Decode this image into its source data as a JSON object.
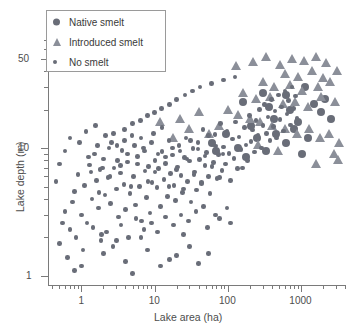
{
  "chart_data": {
    "type": "scatter",
    "title": "",
    "xlabel": "Lake area (ha)",
    "ylabel": "Lake depth (m)",
    "xscale": "log",
    "yscale": "log",
    "xlim": [
      0.35,
      4000
    ],
    "ylim": [
      0.85,
      70
    ],
    "xticks": [
      1,
      10,
      100,
      1000
    ],
    "xticklabels": [
      "1",
      "10",
      "100",
      "1000"
    ],
    "yticks": [
      1,
      10,
      50
    ],
    "yticklabels": [
      "1",
      "10",
      "50"
    ],
    "grid": false,
    "legend_position": "top-left",
    "series": [
      {
        "name": "Native smelt",
        "marker": "circle-large",
        "color": "#696d78",
        "points": [
          [
            160,
            23
          ],
          [
            300,
            27
          ],
          [
            620,
            26
          ],
          [
            1150,
            30
          ],
          [
            1500,
            22
          ],
          [
            430,
            17
          ],
          [
            800,
            14
          ],
          [
            250,
            12
          ],
          [
            95,
            13
          ],
          [
            1900,
            19
          ],
          [
            620,
            11
          ],
          [
            330,
            9.5
          ],
          [
            1250,
            12
          ],
          [
            180,
            8.5
          ],
          [
            700,
            20
          ],
          [
            2100,
            24
          ],
          [
            140,
            10
          ],
          [
            60,
            11
          ],
          [
            900,
            16
          ],
          [
            2600,
            17
          ],
          [
            460,
            13
          ],
          [
            1050,
            9
          ],
          [
            210,
            15
          ],
          [
            70,
            9.5
          ],
          [
            370,
            21
          ]
        ]
      },
      {
        "name": "Introduced smelt",
        "marker": "triangle",
        "color": "#8b8f99",
        "points": [
          [
            130,
            44
          ],
          [
            220,
            47
          ],
          [
            330,
            52
          ],
          [
            520,
            45
          ],
          [
            760,
            50
          ],
          [
            1100,
            48
          ],
          [
            1600,
            52
          ],
          [
            2200,
            46
          ],
          [
            600,
            38
          ],
          [
            900,
            36
          ],
          [
            1400,
            40
          ],
          [
            2000,
            35
          ],
          [
            300,
            33
          ],
          [
            430,
            30
          ],
          [
            700,
            31
          ],
          [
            1050,
            28
          ],
          [
            1700,
            30
          ],
          [
            2500,
            33
          ],
          [
            160,
            27
          ],
          [
            240,
            24
          ],
          [
            380,
            25
          ],
          [
            560,
            22
          ],
          [
            820,
            23
          ],
          [
            1250,
            21
          ],
          [
            1900,
            25
          ],
          [
            2900,
            23
          ],
          [
            3100,
            40
          ],
          [
            3300,
            11
          ],
          [
            100,
            20
          ],
          [
            140,
            18
          ],
          [
            200,
            17
          ],
          [
            280,
            16
          ],
          [
            400,
            15
          ],
          [
            600,
            14
          ],
          [
            880,
            13
          ],
          [
            1300,
            14
          ],
          [
            1800,
            12
          ],
          [
            2400,
            13
          ],
          [
            75,
            15
          ],
          [
            55,
            13
          ],
          [
            40,
            19
          ],
          [
            30,
            14
          ],
          [
            22,
            17
          ],
          [
            18,
            12
          ],
          [
            12,
            16
          ],
          [
            2800,
            9
          ],
          [
            3200,
            8
          ],
          [
            480,
            9.5
          ],
          [
            260,
            10.5
          ],
          [
            1600,
            7.5
          ]
        ]
      },
      {
        "name": "No smelt",
        "marker": "circle-small",
        "color": "#696d78",
        "points": [
          [
            0.6,
            3.2
          ],
          [
            0.7,
            2.3
          ],
          [
            0.8,
            4.6
          ],
          [
            0.9,
            6.2
          ],
          [
            1.0,
            3.0
          ],
          [
            1.1,
            5.1
          ],
          [
            1.2,
            2.6
          ],
          [
            1.3,
            7.4
          ],
          [
            1.4,
            4.0
          ],
          [
            1.5,
            9.0
          ],
          [
            1.6,
            5.6
          ],
          [
            1.7,
            3.4
          ],
          [
            1.8,
            6.8
          ],
          [
            1.9,
            2.1
          ],
          [
            2.0,
            8.2
          ],
          [
            2.1,
            4.3
          ],
          [
            2.3,
            5.9
          ],
          [
            2.5,
            3.7
          ],
          [
            2.6,
            11.0
          ],
          [
            2.8,
            7.0
          ],
          [
            3.0,
            4.8
          ],
          [
            3.2,
            2.9
          ],
          [
            3.4,
            6.4
          ],
          [
            3.6,
            9.6
          ],
          [
            3.8,
            5.2
          ],
          [
            4.0,
            3.3
          ],
          [
            4.3,
            7.8
          ],
          [
            4.6,
            4.4
          ],
          [
            4.9,
            12.5
          ],
          [
            5.2,
            6.0
          ],
          [
            5.5,
            3.6
          ],
          [
            5.8,
            8.6
          ],
          [
            6.2,
            5.0
          ],
          [
            6.6,
            2.7
          ],
          [
            7.0,
            10.0
          ],
          [
            7.4,
            6.6
          ],
          [
            7.8,
            4.1
          ],
          [
            8.2,
            7.2
          ],
          [
            8.7,
            3.1
          ],
          [
            9.2,
            5.4
          ],
          [
            9.7,
            13.0
          ],
          [
            10.2,
            8.0
          ],
          [
            10.8,
            4.9
          ],
          [
            11.4,
            6.9
          ],
          [
            12.0,
            3.5
          ],
          [
            12.7,
            9.4
          ],
          [
            13.4,
            5.7
          ],
          [
            14.1,
            7.6
          ],
          [
            14.9,
            4.2
          ],
          [
            15.7,
            11.5
          ],
          [
            16.6,
            6.3
          ],
          [
            17.5,
            8.8
          ],
          [
            18.5,
            5.1
          ],
          [
            19.5,
            3.9
          ],
          [
            20.6,
            7.1
          ],
          [
            21.7,
            10.5
          ],
          [
            22.9,
            6.1
          ],
          [
            24.2,
            4.5
          ],
          [
            25.5,
            8.4
          ],
          [
            26.9,
            12.0
          ],
          [
            28.4,
            5.5
          ],
          [
            30.0,
            7.9
          ],
          [
            31.6,
            3.8
          ],
          [
            33.4,
            9.9
          ],
          [
            35.2,
            6.5
          ],
          [
            37.2,
            4.7
          ],
          [
            39.2,
            11.0
          ],
          [
            41.4,
            8.1
          ],
          [
            43.7,
            5.3
          ],
          [
            46.1,
            14.0
          ],
          [
            48.7,
            7.3
          ],
          [
            51.4,
            9.2
          ],
          [
            54.2,
            6.0
          ],
          [
            57.2,
            4.4
          ],
          [
            60.4,
            10.8
          ],
          [
            63.7,
            7.7
          ],
          [
            67.3,
            12.8
          ],
          [
            71.0,
            5.8
          ],
          [
            74.9,
            8.9
          ],
          [
            79.1,
            15.5
          ],
          [
            83.4,
            6.7
          ],
          [
            88.0,
            10.2
          ],
          [
            92.9,
            7.5
          ],
          [
            98.0,
            13.5
          ],
          [
            103.4,
            9.1
          ],
          [
            109.2,
            5.6
          ],
          [
            115.2,
            11.8
          ],
          [
            121.6,
            8.3
          ],
          [
            128.3,
            16.0
          ],
          [
            135.4,
            6.9
          ],
          [
            142.9,
            12.2
          ],
          [
            150.8,
            9.7
          ],
          [
            159.1,
            7.0
          ],
          [
            167.9,
            14.5
          ],
          [
            177.2,
            10.6
          ],
          [
            187.0,
            8.0
          ],
          [
            197.3,
            18.0
          ],
          [
            208.2,
            11.2
          ],
          [
            219.7,
            13.8
          ],
          [
            231.8,
            9.3
          ],
          [
            244.6,
            16.5
          ],
          [
            258.1,
            12.6
          ],
          [
            272.4,
            20.0
          ],
          [
            287.4,
            10.0
          ],
          [
            303.3,
            15.0
          ],
          [
            320.0,
            22.0
          ],
          [
            337.7,
            13.0
          ],
          [
            356.3,
            17.5
          ],
          [
            375.9,
            11.5
          ],
          [
            396.6,
            24.0
          ],
          [
            418.5,
            14.8
          ],
          [
            441.6,
            19.5
          ],
          [
            465.9,
            12.0
          ],
          [
            491.5,
            26.0
          ],
          [
            518.6,
            16.8
          ],
          [
            547.1,
            21.0
          ],
          [
            577.2,
            13.6
          ],
          [
            609.0,
            28.0
          ],
          [
            642.5,
            18.5
          ],
          [
            677.8,
            23.5
          ],
          [
            715.1,
            15.2
          ],
          [
            754.4,
            30.0
          ],
          [
            795.9,
            20.5
          ],
          [
            839.7,
            25.5
          ],
          [
            885.9,
            17.0
          ],
          [
            0.5,
            1.8
          ],
          [
            0.55,
            2.6
          ],
          [
            0.65,
            1.4
          ],
          [
            0.75,
            3.8
          ],
          [
            0.85,
            2.0
          ],
          [
            1.05,
            1.6
          ],
          [
            1.25,
            8.5
          ],
          [
            1.45,
            2.4
          ],
          [
            1.65,
            10.5
          ],
          [
            1.85,
            1.9
          ],
          [
            2.2,
            2.2
          ],
          [
            2.4,
            10.0
          ],
          [
            2.7,
            1.7
          ],
          [
            3.1,
            8.0
          ],
          [
            3.5,
            2.5
          ],
          [
            3.9,
            14.0
          ],
          [
            4.4,
            2.0
          ],
          [
            5.0,
            15.5
          ],
          [
            5.6,
            2.8
          ],
          [
            6.4,
            16.5
          ],
          [
            7.2,
            2.3
          ],
          [
            8.0,
            18.0
          ],
          [
            9.0,
            2.6
          ],
          [
            10.0,
            19.0
          ],
          [
            11.0,
            2.2
          ],
          [
            12.5,
            20.5
          ],
          [
            14.0,
            2.9
          ],
          [
            16.0,
            22.0
          ],
          [
            18.0,
            2.5
          ],
          [
            20.0,
            24.0
          ],
          [
            23.0,
            3.0
          ],
          [
            26.0,
            26.0
          ],
          [
            29.0,
            2.7
          ],
          [
            33.0,
            28.0
          ],
          [
            37.0,
            3.2
          ],
          [
            42.0,
            30.0
          ],
          [
            47.0,
            3.5
          ],
          [
            53.0,
            2.4
          ],
          [
            60.0,
            32.0
          ],
          [
            68.0,
            3.0
          ],
          [
            77.0,
            2.8
          ],
          [
            87.0,
            34.0
          ],
          [
            98.0,
            3.4
          ],
          [
            110.0,
            2.6
          ],
          [
            125.0,
            36.0
          ],
          [
            0.45,
            5.5
          ],
          [
            0.5,
            7.5
          ],
          [
            0.6,
            9.5
          ],
          [
            0.7,
            12.0
          ],
          [
            0.95,
            11.0
          ],
          [
            1.15,
            13.5
          ],
          [
            1.35,
            6.5
          ],
          [
            1.55,
            15.0
          ],
          [
            1.75,
            4.5
          ],
          [
            1.95,
            7.0
          ],
          [
            2.15,
            12.5
          ],
          [
            2.45,
            6.0
          ],
          [
            2.75,
            13.0
          ],
          [
            3.05,
            10.5
          ],
          [
            3.45,
            7.3
          ],
          [
            3.85,
            11.5
          ],
          [
            4.25,
            9.0
          ],
          [
            4.75,
            5.0
          ],
          [
            5.3,
            10.5
          ],
          [
            5.9,
            7.5
          ],
          [
            6.5,
            12.0
          ],
          [
            7.3,
            9.5
          ],
          [
            8.1,
            5.5
          ],
          [
            9.1,
            11.0
          ],
          [
            10.1,
            6.5
          ],
          [
            11.2,
            9.0
          ],
          [
            12.6,
            14.5
          ],
          [
            14.2,
            8.5
          ],
          [
            15.8,
            5.0
          ],
          [
            17.7,
            10.0
          ],
          [
            19.8,
            6.8
          ],
          [
            22.2,
            9.5
          ],
          [
            24.8,
            4.8
          ],
          [
            27.8,
            8.2
          ],
          [
            31.1,
            11.5
          ],
          [
            34.8,
            6.2
          ],
          [
            39.0,
            9.8
          ],
          [
            43.6,
            5.4
          ],
          [
            48.8,
            8.7
          ],
          [
            54.6,
            12.5
          ],
          [
            61.1,
            7.2
          ],
          [
            68.4,
            10.4
          ],
          [
            76.5,
            5.9
          ],
          [
            85.6,
            9.0
          ],
          [
            95.8,
            13.2
          ],
          [
            1.0,
            1.2
          ],
          [
            2.0,
            1.5
          ],
          [
            4.0,
            1.3
          ],
          [
            8.0,
            1.6
          ],
          [
            16.0,
            1.35
          ],
          [
            5.0,
            1.05
          ],
          [
            30.0,
            1.7
          ],
          [
            55.0,
            1.5
          ],
          [
            12.0,
            1.2
          ],
          [
            0.8,
            1.1
          ],
          [
            20.0,
            1.45
          ],
          [
            40.0,
            1.25
          ],
          [
            3.0,
            1.9
          ],
          [
            6.5,
            2.0
          ],
          [
            25.0,
            2.1
          ]
        ]
      }
    ]
  },
  "legend": {
    "items": [
      {
        "label": "Native smelt",
        "marker": "circle-large"
      },
      {
        "label": "Introduced smelt",
        "marker": "triangle"
      },
      {
        "label": "No smelt",
        "marker": "circle-small"
      }
    ]
  },
  "colors": {
    "marker": "#696d78",
    "triangle": "#8b8f99",
    "axis": "#7a7a7a",
    "text": "#4d4d4d",
    "legend_border": "#9a9a9a",
    "background": "#ffffff"
  }
}
